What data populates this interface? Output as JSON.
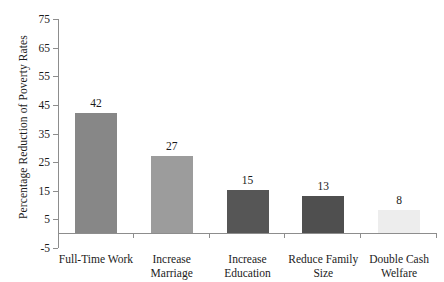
{
  "chart_data": {
    "type": "bar",
    "title": "",
    "xlabel": "",
    "ylabel": "Percentage Reduction of Poverty Rates",
    "categories": [
      "Full-Time Work",
      "Increase Marriage",
      "Increase Education",
      "Reduce Family Size",
      "Double Cash Welfare"
    ],
    "values": [
      42,
      27,
      15,
      13,
      8
    ],
    "value_labels": [
      "42",
      "27",
      "15",
      "13",
      "8"
    ],
    "bar_colors": [
      "#878787",
      "#9c9c9c",
      "#565656",
      "#4f4f4f",
      "#ededed"
    ],
    "ylim": [
      -5,
      75
    ],
    "yticks": [
      75,
      65,
      55,
      45,
      35,
      25,
      15,
      5,
      -5
    ],
    "ytick_labels": [
      "75",
      "65",
      "55",
      "45",
      "35",
      "25",
      "15",
      "5",
      "-5"
    ],
    "grid": false,
    "legend": null,
    "axis_color": "#8d8d8d",
    "background": "#ffffff"
  },
  "category_lines": [
    [
      "Full-Time Work"
    ],
    [
      "Increase",
      "Marriage"
    ],
    [
      "Increase",
      "Education"
    ],
    [
      "Reduce Family",
      "Size"
    ],
    [
      "Double Cash",
      "Welfare"
    ]
  ]
}
